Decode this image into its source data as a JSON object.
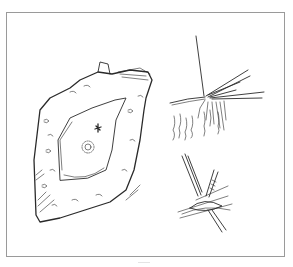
{
  "figure": {
    "frame_color": "#9a9a9a",
    "ink_color": "#2a2a2a",
    "panels": [
      {
        "name": "specimen",
        "content": "irregular tissue block with smooth central ellipse, star mark and concentric ring mark"
      },
      {
        "name": "needle-insertion",
        "content": "needle and fine instruments entering tissue edge with hanging fibers"
      },
      {
        "name": "forceps-closure",
        "content": "forceps holding tissue with sutures"
      }
    ]
  }
}
